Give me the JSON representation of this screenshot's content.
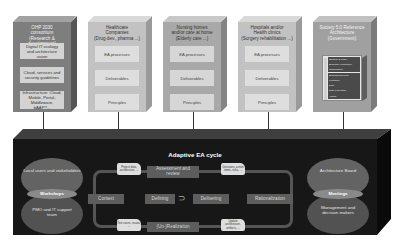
{
  "columns": [
    {
      "title": [
        "OHP 2030",
        "consortium",
        "(Research & development)"
      ],
      "items": [
        "Digital IT ecology and architecture vision",
        "Cloud, services and security guidelines",
        "Infrastructure: Cloud, Mobile, Portal, Middleware, bAAP?..."
      ]
    },
    {
      "title": [
        "Healthcare",
        "Companies",
        "(Drug dev., pharma ...)"
      ],
      "items": [
        "EA processes",
        "Deliverables",
        "Principles"
      ]
    },
    {
      "title": [
        "Nursing homes",
        "and/or care at home",
        "(Elderly care ...)"
      ],
      "items": [
        "EA processes",
        "Deliverables",
        "Principles"
      ]
    },
    {
      "title": [
        "Hospitals and/or",
        "Health clinics",
        "(Surgery rehabilitation ...)"
      ],
      "items": [
        "EA processes",
        "Deliverables",
        "Principles"
      ]
    },
    {
      "title": [
        "Society 5.0 Reference",
        "Architecture",
        "(Government)"
      ],
      "reference_layers": [
        "Strategy & Policy",
        "Business Architecture",
        "Organization",
        "Business Services",
        "Functions",
        "Data",
        "Data Federation",
        "Assets"
      ]
    }
  ],
  "cycle": {
    "title": "Adaptive EA cycle",
    "stages": {
      "context": "Context",
      "defining": "Defining",
      "delivering": "Delivering",
      "assessment": "Assessment and review",
      "rationalization": "Rationalization",
      "realization": "(Un-)Realization"
    },
    "notes": {
      "top_left": "Project data, architecture, ...",
      "top_right": "Decisions, action items, risks, ...",
      "bottom_left": "Test cases, issues, ...",
      "bottom_right": "Update architecture, artifacts, ..."
    },
    "left_group": {
      "upper": "Local users and stakeholders",
      "middle": "Workshops",
      "lower": "PMO and IT support team"
    },
    "right_group": {
      "upper": "Architecture Board",
      "middle": "Meetings",
      "lower": "Management and decision makers"
    }
  }
}
